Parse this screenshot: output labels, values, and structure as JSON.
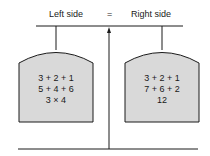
{
  "header": {
    "left_label": "Left side",
    "equals": "=",
    "right_label": "Right side"
  },
  "left_pan": {
    "lines": [
      "3 + 2 + 1",
      "5 + 4 + 6",
      "3 × 4"
    ]
  },
  "right_pan": {
    "lines": [
      "3 + 2 + 1",
      "7 + 6 + 2",
      "12"
    ]
  },
  "colors": {
    "pan_fill": "#d9d9d9",
    "line": "#1a1a1a"
  }
}
